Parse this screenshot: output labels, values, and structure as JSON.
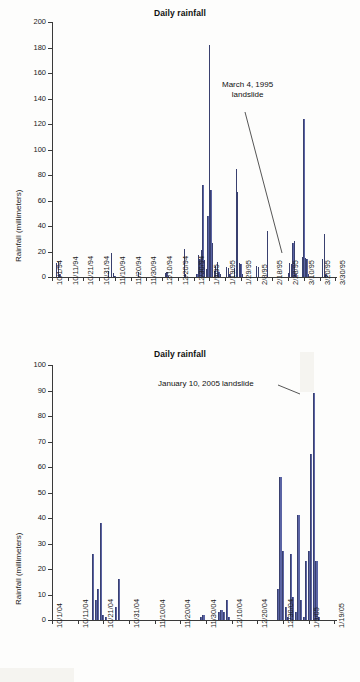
{
  "charts": [
    {
      "id": "top",
      "title": "Daily rainfall",
      "ylabel": "Rainfall (millimeters)",
      "annotation": "March 4, 1995\nlandslide",
      "annotation_line1": "March 4, 1995",
      "annotation_line2": "landslide",
      "chart_data": {
        "type": "bar",
        "title": "Daily rainfall",
        "xlabel": "",
        "ylabel": "Rainfall (millimeters)",
        "ylim": [
          0,
          200
        ],
        "ytick_step": 20,
        "ytick_labels": [
          "0",
          "20",
          "40",
          "60",
          "80",
          "100",
          "120",
          "140",
          "160",
          "180",
          "200"
        ],
        "xtick_labels": [
          "10/1/94",
          "10/11/94",
          "10/21/94",
          "10/31/94",
          "11/10/94",
          "11/20/94",
          "11/30/94",
          "12/10/94",
          "12/20/94",
          "12/30/94",
          "1/9/95",
          "1/19/95",
          "1/29/95",
          "2/8/95",
          "2/18/95",
          "2/28/95",
          "3/10/95",
          "3/20/95",
          "3/30/95"
        ],
        "x_start": "10/1/94",
        "x_end": "3/30/95",
        "x_days": 181,
        "grid": false,
        "legend": "none",
        "annotations": [
          {
            "text": "March 4, 1995 landslide",
            "points_to_day": 155,
            "points_to_value": 28
          }
        ],
        "series": [
          {
            "name": "Daily rainfall (mm)",
            "color": "#5b64a4",
            "points": [
              {
                "day": 3,
                "value": 11
              },
              {
                "day": 4,
                "value": 12
              },
              {
                "day": 5,
                "value": 2
              },
              {
                "day": 36,
                "value": 5
              },
              {
                "day": 38,
                "value": 19
              },
              {
                "day": 39,
                "value": 3
              },
              {
                "day": 40,
                "value": 1
              },
              {
                "day": 55,
                "value": 4
              },
              {
                "day": 72,
                "value": 3
              },
              {
                "day": 73,
                "value": 4
              },
              {
                "day": 74,
                "value": 1
              },
              {
                "day": 84,
                "value": 22
              },
              {
                "day": 85,
                "value": 2
              },
              {
                "day": 92,
                "value": 2
              },
              {
                "day": 93,
                "value": 17
              },
              {
                "day": 94,
                "value": 14
              },
              {
                "day": 95,
                "value": 21
              },
              {
                "day": 96,
                "value": 72
              },
              {
                "day": 97,
                "value": 13
              },
              {
                "day": 98,
                "value": 6
              },
              {
                "day": 99,
                "value": 48
              },
              {
                "day": 100,
                "value": 182
              },
              {
                "day": 101,
                "value": 68
              },
              {
                "day": 102,
                "value": 27
              },
              {
                "day": 103,
                "value": 5
              },
              {
                "day": 104,
                "value": 9
              },
              {
                "day": 105,
                "value": 12
              },
              {
                "day": 106,
                "value": 4
              },
              {
                "day": 107,
                "value": 2
              },
              {
                "day": 111,
                "value": 8
              },
              {
                "day": 112,
                "value": 7
              },
              {
                "day": 113,
                "value": 2
              },
              {
                "day": 116,
                "value": 7
              },
              {
                "day": 117,
                "value": 85
              },
              {
                "day": 118,
                "value": 67
              },
              {
                "day": 119,
                "value": 11
              },
              {
                "day": 120,
                "value": 10
              },
              {
                "day": 121,
                "value": 2
              },
              {
                "day": 130,
                "value": 9
              },
              {
                "day": 131,
                "value": 8
              },
              {
                "day": 137,
                "value": 36
              },
              {
                "day": 150,
                "value": 3
              },
              {
                "day": 151,
                "value": 11
              },
              {
                "day": 152,
                "value": 10
              },
              {
                "day": 153,
                "value": 27
              },
              {
                "day": 154,
                "value": 28
              },
              {
                "day": 155,
                "value": 2
              },
              {
                "day": 159,
                "value": 16
              },
              {
                "day": 160,
                "value": 124
              },
              {
                "day": 161,
                "value": 15
              },
              {
                "day": 162,
                "value": 14
              },
              {
                "day": 163,
                "value": 2
              },
              {
                "day": 172,
                "value": 14
              },
              {
                "day": 173,
                "value": 34
              },
              {
                "day": 174,
                "value": 2
              },
              {
                "day": 175,
                "value": 1
              }
            ]
          }
        ]
      }
    },
    {
      "id": "bottom",
      "title": "Daily rainfall",
      "ylabel": "Rainfall (millimeters)",
      "annotation": "January 10, 2005 landslide",
      "annotation_line1": "January 10, 2005 landslide",
      "annotation_line2": "",
      "chart_data": {
        "type": "bar",
        "title": "Daily rainfall",
        "xlabel": "",
        "ylabel": "Rainfall (millimeters)",
        "ylim": [
          0,
          100
        ],
        "ytick_step": 10,
        "ytick_labels": [
          "0",
          "10",
          "20",
          "30",
          "40",
          "50",
          "60",
          "70",
          "80",
          "90",
          "100"
        ],
        "xtick_labels": [
          "10/1/04",
          "10/11/04",
          "10/21/04",
          "10/31/04",
          "11/10/04",
          "11/20/04",
          "11/30/04",
          "12/10/04",
          "12/20/04",
          "12/30/04",
          "1/9/05",
          "1/19/05"
        ],
        "x_start": "10/1/04",
        "x_end": "1/19/05",
        "x_days": 111,
        "grid": false,
        "legend": "none",
        "annotations": [
          {
            "text": "January 10, 2005 landslide",
            "points_to_day": 101,
            "points_to_value": 89
          }
        ],
        "series": [
          {
            "name": "Daily rainfall (mm)",
            "color": "#5b64a4",
            "points": [
              {
                "day": 16,
                "value": 26
              },
              {
                "day": 17,
                "value": 8
              },
              {
                "day": 18,
                "value": 12
              },
              {
                "day": 19,
                "value": 38
              },
              {
                "day": 20,
                "value": 2
              },
              {
                "day": 21,
                "value": 1
              },
              {
                "day": 25,
                "value": 5
              },
              {
                "day": 26,
                "value": 16
              },
              {
                "day": 58,
                "value": 1
              },
              {
                "day": 59,
                "value": 2
              },
              {
                "day": 65,
                "value": 3
              },
              {
                "day": 66,
                "value": 4
              },
              {
                "day": 67,
                "value": 3
              },
              {
                "day": 68,
                "value": 8
              },
              {
                "day": 69,
                "value": 1
              },
              {
                "day": 88,
                "value": 12
              },
              {
                "day": 89,
                "value": 56
              },
              {
                "day": 90,
                "value": 27
              },
              {
                "day": 91,
                "value": 5
              },
              {
                "day": 92,
                "value": 1
              },
              {
                "day": 93,
                "value": 26
              },
              {
                "day": 94,
                "value": 9
              },
              {
                "day": 95,
                "value": 3
              },
              {
                "day": 96,
                "value": 41
              },
              {
                "day": 97,
                "value": 8
              },
              {
                "day": 98,
                "value": 1
              },
              {
                "day": 99,
                "value": 23
              },
              {
                "day": 100,
                "value": 27
              },
              {
                "day": 101,
                "value": 65
              },
              {
                "day": 102,
                "value": 89
              },
              {
                "day": 103,
                "value": 23
              },
              {
                "day": 104,
                "value": 1
              }
            ]
          }
        ]
      }
    }
  ]
}
